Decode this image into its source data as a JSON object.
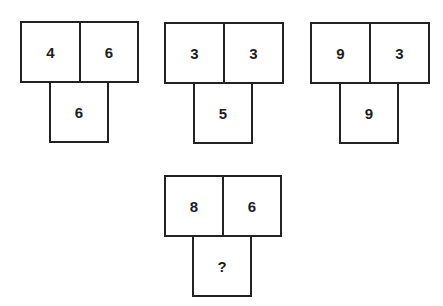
{
  "puzzle": {
    "groups": [
      {
        "top_left": "4",
        "top_right": "6",
        "bottom": "6"
      },
      {
        "top_left": "3",
        "top_right": "3",
        "bottom": "5"
      },
      {
        "top_left": "9",
        "top_right": "3",
        "bottom": "9"
      },
      {
        "top_left": "8",
        "top_right": "6",
        "bottom": "?"
      }
    ]
  }
}
